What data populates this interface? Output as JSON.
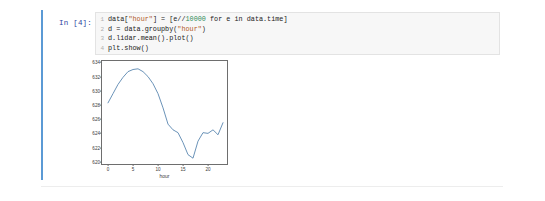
{
  "cell": {
    "prompt_label": "In [4]:",
    "code_lines": [
      {
        "number": "1",
        "segments": [
          {
            "text": "data[",
            "type": "plain"
          },
          {
            "text": "\"hour\"",
            "type": "string"
          },
          {
            "text": "] = [e//",
            "type": "plain"
          },
          {
            "text": "10000",
            "type": "number"
          },
          {
            "text": " for e in data.time]",
            "type": "plain"
          }
        ]
      },
      {
        "number": "2",
        "segments": [
          {
            "text": "d = data.groupby(",
            "type": "plain"
          },
          {
            "text": "\"hour\"",
            "type": "string"
          },
          {
            "text": ")",
            "type": "plain"
          }
        ]
      },
      {
        "number": "3",
        "segments": [
          {
            "text": "d.lidar.mean().plot()",
            "type": "plain"
          }
        ]
      },
      {
        "number": "4",
        "segments": [
          {
            "text": "plt.show()",
            "type": "plain"
          }
        ]
      }
    ]
  },
  "chart_data": {
    "type": "line",
    "title": "",
    "xlabel": "hour",
    "ylabel": "",
    "xlim": [
      -1.2,
      24.2
    ],
    "ylim": [
      619.4,
      634.2
    ],
    "xticks": [
      "0",
      "5",
      "10",
      "15",
      "20"
    ],
    "xtick_values": [
      0,
      5,
      10,
      15,
      20
    ],
    "yticks": [
      "620",
      "622",
      "624",
      "626",
      "628",
      "630",
      "632",
      "634"
    ],
    "ytick_values": [
      620,
      622,
      624,
      626,
      628,
      630,
      632,
      634
    ],
    "grid": false,
    "legend": false,
    "line_color": "#5a87b0",
    "x": [
      0,
      1,
      2,
      3,
      4,
      5,
      6,
      7,
      8,
      9,
      10,
      11,
      12,
      13,
      14,
      15,
      16,
      17,
      18,
      19,
      20,
      21,
      22,
      23
    ],
    "series": [
      {
        "name": "lidar",
        "values": [
          628.3,
          629.6,
          630.9,
          631.9,
          632.7,
          633.0,
          633.1,
          632.7,
          632.0,
          631.0,
          629.6,
          627.6,
          625.3,
          624.5,
          624.1,
          622.7,
          621.0,
          620.5,
          622.9,
          624.1,
          624.0,
          624.5,
          623.8,
          625.5
        ]
      }
    ]
  }
}
